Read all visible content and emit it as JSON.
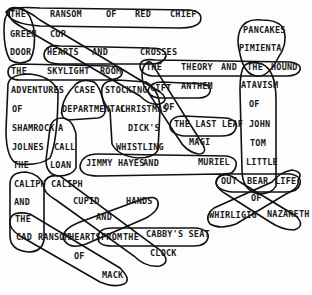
{
  "puzzle": {
    "words": [
      {
        "text": "THE",
        "x": 10,
        "y": 14
      },
      {
        "text": "RANSOM",
        "x": 50,
        "y": 14
      },
      {
        "text": "OF",
        "x": 106,
        "y": 14
      },
      {
        "text": "RED",
        "x": 135,
        "y": 14
      },
      {
        "text": "CHIEF",
        "x": 170,
        "y": 14
      },
      {
        "text": "GREEN",
        "x": 10,
        "y": 34
      },
      {
        "text": "COP",
        "x": 50,
        "y": 34
      },
      {
        "text": "DOOR",
        "x": 10,
        "y": 52
      },
      {
        "text": "HEARTS",
        "x": 47,
        "y": 52
      },
      {
        "text": "AND",
        "x": 92,
        "y": 52
      },
      {
        "text": "CROSSES",
        "x": 140,
        "y": 52
      },
      {
        "text": "THE",
        "x": 11,
        "y": 71
      },
      {
        "text": "SKYLIGHT",
        "x": 47,
        "y": 71
      },
      {
        "text": "ROOM",
        "x": 100,
        "y": 71
      },
      {
        "text": "THE",
        "x": 146,
        "y": 67
      },
      {
        "text": "THEORY",
        "x": 181,
        "y": 67
      },
      {
        "text": "AND",
        "x": 221,
        "y": 67
      },
      {
        "text": "THE",
        "x": 247,
        "y": 67
      },
      {
        "text": "HOUND",
        "x": 271,
        "y": 67
      },
      {
        "text": "PANCAKES",
        "x": 243,
        "y": 30
      },
      {
        "text": "PIMIENTA",
        "x": 239,
        "y": 48
      },
      {
        "text": "ADVENTURES",
        "x": 11,
        "y": 90
      },
      {
        "text": "CASE",
        "x": 74,
        "y": 90
      },
      {
        "text": "STOCKING",
        "x": 105,
        "y": 90
      },
      {
        "text": "GIFT",
        "x": 150,
        "y": 88
      },
      {
        "text": "ANTHEM",
        "x": 181,
        "y": 86
      },
      {
        "text": "ATAVISM",
        "x": 241,
        "y": 85
      },
      {
        "text": "OF",
        "x": 12,
        "y": 109
      },
      {
        "text": "DEPARTMENTAL",
        "x": 62,
        "y": 109
      },
      {
        "text": "CHRISTMAS",
        "x": 120,
        "y": 109
      },
      {
        "text": "OF",
        "x": 164,
        "y": 107
      },
      {
        "text": "OF",
        "x": 249,
        "y": 104
      },
      {
        "text": "SHAMROCK",
        "x": 12,
        "y": 128
      },
      {
        "text": "A",
        "x": 58,
        "y": 128
      },
      {
        "text": "DICK'S",
        "x": 128,
        "y": 128
      },
      {
        "text": "THE LAST LEAF",
        "x": 174,
        "y": 124
      },
      {
        "text": "JOHN",
        "x": 249,
        "y": 124
      },
      {
        "text": "JOLNES",
        "x": 12,
        "y": 147
      },
      {
        "text": "CALL",
        "x": 54,
        "y": 147
      },
      {
        "text": "WHISTLING",
        "x": 116,
        "y": 147
      },
      {
        "text": "MAGI",
        "x": 189,
        "y": 142
      },
      {
        "text": "TOM",
        "x": 250,
        "y": 143
      },
      {
        "text": "THE",
        "x": 13,
        "y": 165
      },
      {
        "text": "LOAN",
        "x": 50,
        "y": 165
      },
      {
        "text": "JIMMY HAYES",
        "x": 86,
        "y": 163
      },
      {
        "text": "AND",
        "x": 143,
        "y": 163
      },
      {
        "text": "MURIEL",
        "x": 198,
        "y": 162
      },
      {
        "text": "LITTLE",
        "x": 246,
        "y": 162
      },
      {
        "text": "OUT",
        "x": 221,
        "y": 181
      },
      {
        "text": "BEAR",
        "x": 247,
        "y": 181
      },
      {
        "text": "LIFE",
        "x": 275,
        "y": 181
      },
      {
        "text": "CALIPH",
        "x": 14,
        "y": 184
      },
      {
        "text": "CALIPH",
        "x": 51,
        "y": 184
      },
      {
        "text": "OF",
        "x": 251,
        "y": 198
      },
      {
        "text": "AND",
        "x": 14,
        "y": 202
      },
      {
        "text": "CUPID",
        "x": 73,
        "y": 201
      },
      {
        "text": "HANDS",
        "x": 126,
        "y": 201
      },
      {
        "text": "WHIRLIGIG",
        "x": 209,
        "y": 215
      },
      {
        "text": "NAZARETH",
        "x": 267,
        "y": 214
      },
      {
        "text": "THE",
        "x": 15,
        "y": 219
      },
      {
        "text": "AND",
        "x": 96,
        "y": 217
      },
      {
        "text": "CAD",
        "x": 16,
        "y": 237
      },
      {
        "text": "RANSOM",
        "x": 38,
        "y": 237
      },
      {
        "text": "HEARTS",
        "x": 69,
        "y": 237
      },
      {
        "text": "FROM",
        "x": 101,
        "y": 237
      },
      {
        "text": "THE",
        "x": 123,
        "y": 237
      },
      {
        "text": "CABBY'S SEAT",
        "x": 146,
        "y": 234
      },
      {
        "text": "OF",
        "x": 74,
        "y": 256
      },
      {
        "text": "CLOCK",
        "x": 150,
        "y": 253
      },
      {
        "text": "MACK",
        "x": 102,
        "y": 275
      }
    ]
  }
}
